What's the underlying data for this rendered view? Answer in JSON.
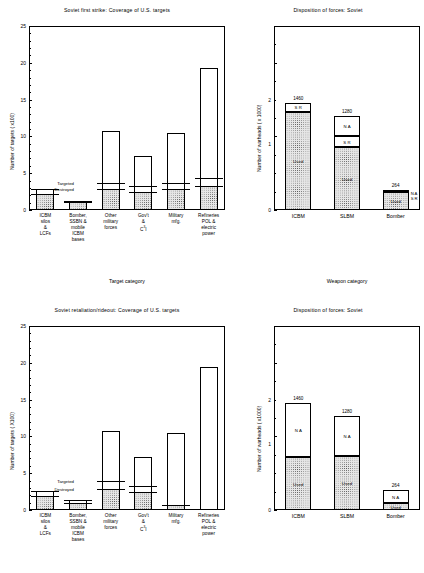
{
  "figure": {
    "panels": [
      {
        "id": "top-left",
        "title": "Soviet first strike:  Coverage of U.S. targets",
        "chart_data": {
          "type": "bar",
          "title": "Soviet first strike:  Coverage of U.S. targets",
          "xlabel": "Target category",
          "ylabel": "Number of targets ( x100)",
          "ylim": [
            0,
            25
          ],
          "yticks": [
            0,
            5,
            10,
            15,
            20,
            25
          ],
          "ytick_labels": [
            "0",
            "5",
            "10",
            "15",
            "20",
            "25"
          ],
          "grid": false,
          "categories": [
            "ICBM silos & LCFs",
            "Bomber, SSBN & mobile ICBM bases",
            "Other military forces",
            "Gov't & C3I",
            "Military mfg.",
            "Refineries POL & electric power"
          ],
          "series": [
            {
              "name": "Total targets",
              "values": [
                2.9,
                1.2,
                10.8,
                7.3,
                10.5,
                19.3
              ]
            },
            {
              "name": "Covered (shaded)",
              "values": [
                2.2,
                1.1,
                2.8,
                2.5,
                2.8,
                3.2
              ]
            },
            {
              "name": "Targeted",
              "values": [
                2.9,
                1.2,
                3.7,
                3.2,
                3.7,
                4.4
              ]
            },
            {
              "name": "Destroyed",
              "values": [
                2.2,
                1.1,
                2.8,
                2.5,
                2.8,
                3.2
              ]
            }
          ],
          "annotations": [
            {
              "label": "Targeted",
              "series": "Targeted"
            },
            {
              "label": "Destroyed",
              "series": "Destroyed"
            }
          ]
        }
      },
      {
        "id": "top-right",
        "title": "Disposition of forces: Soviet",
        "chart_data": {
          "type": "bar",
          "title": "Disposition of forces: Soviet",
          "xlabel": "Weapon category",
          "ylabel": "Number of warheads ( x 1000)",
          "ylim": [
            0,
            2.5
          ],
          "yticks": [
            0,
            1,
            2
          ],
          "ytick_labels": [
            "0",
            "1",
            "2"
          ],
          "grid": false,
          "categories": [
            "ICBM",
            "SLBM",
            "Bomber"
          ],
          "totals": [
            1460,
            1280,
            264
          ],
          "total_labels": [
            "1460",
            "1280",
            "264"
          ],
          "stacks": [
            {
              "category": "ICBM",
              "segments": [
                {
                  "label": "Used",
                  "value": 1.33,
                  "style": "hatch"
                },
                {
                  "label": "S R",
                  "value": 0.13,
                  "style": "plain"
                }
              ]
            },
            {
              "category": "SLBM",
              "segments": [
                {
                  "label": "Used",
                  "value": 0.85,
                  "style": "hatch"
                },
                {
                  "label": "S R",
                  "value": 0.15,
                  "style": "plain"
                },
                {
                  "label": "N A",
                  "value": 0.28,
                  "style": "plain"
                }
              ]
            },
            {
              "category": "Bomber",
              "segments": [
                {
                  "label": "Used",
                  "value": 0.24,
                  "style": "hatch"
                },
                {
                  "label": "S R",
                  "value": 0.015,
                  "style": "plain"
                },
                {
                  "label": "N A",
                  "value": 0.015,
                  "style": "dark"
                }
              ]
            }
          ],
          "side_labels": {
            "category": "Bomber",
            "labels": [
              "N A",
              "S R"
            ]
          }
        }
      },
      {
        "id": "bottom-left",
        "title": "Soviet retaliation/rideout:  Coverage of U.S. targets",
        "chart_data": {
          "type": "bar",
          "title": "Soviet retaliation/rideout:  Coverage of U.S. targets",
          "xlabel": "Target category",
          "ylabel": "Number of targets ( X100)",
          "ylim": [
            0,
            25
          ],
          "yticks": [
            0,
            5,
            10,
            15,
            20,
            25
          ],
          "ytick_labels": [
            "0",
            "5",
            "10",
            "15",
            "20",
            "25"
          ],
          "grid": false,
          "categories": [
            "ICBM silos & LCFs",
            "Bomber, SSBN & mobile ICBM bases",
            "Other military forces",
            "Gov't & C3I",
            "Military mfg.",
            "Refineries POL & electric power"
          ],
          "series": [
            {
              "name": "Total targets",
              "values": [
                2.6,
                1.3,
                10.7,
                7.2,
                10.5,
                19.4
              ]
            },
            {
              "name": "Covered (shaded)",
              "values": [
                1.9,
                1.0,
                2.8,
                2.4,
                0.7,
                0.0
              ]
            },
            {
              "name": "Targeted",
              "values": [
                2.6,
                1.3,
                3.9,
                3.2,
                0.7,
                0.0
              ]
            },
            {
              "name": "Destroyed",
              "values": [
                1.9,
                1.0,
                2.8,
                2.4,
                0.7,
                0.0
              ]
            }
          ],
          "annotations": [
            {
              "label": "Targeted",
              "series": "Targeted"
            },
            {
              "label": "Destroyed",
              "series": "Destroyed"
            }
          ]
        }
      },
      {
        "id": "bottom-right",
        "title": "Disposition of forces: Soviet",
        "chart_data": {
          "type": "bar",
          "title": "Disposition of forces: Soviet",
          "xlabel": "",
          "ylabel": "Number of warheads ( x1000)",
          "ylim": [
            0,
            2.5
          ],
          "yticks": [
            0,
            1,
            2
          ],
          "ytick_labels": [
            "0",
            "1",
            "2"
          ],
          "grid": false,
          "categories": [
            "ICBM",
            "SLBM",
            "Bomber"
          ],
          "totals": [
            1460,
            1280,
            264
          ],
          "total_labels": [
            "1460",
            "1280",
            "264"
          ],
          "stacks": [
            {
              "category": "ICBM",
              "segments": [
                {
                  "label": "Used",
                  "value": 0.72,
                  "style": "hatch"
                },
                {
                  "label": "N A",
                  "value": 0.74,
                  "style": "plain"
                }
              ]
            },
            {
              "category": "SLBM",
              "segments": [
                {
                  "label": "Used",
                  "value": 0.74,
                  "style": "hatch"
                },
                {
                  "label": "N A",
                  "value": 0.54,
                  "style": "plain"
                }
              ]
            },
            {
              "category": "Bomber",
              "segments": [
                {
                  "label": "Used",
                  "value": 0.09,
                  "style": "hatch"
                },
                {
                  "label": "N A",
                  "value": 0.175,
                  "style": "plain"
                }
              ]
            }
          ]
        }
      }
    ],
    "axis_text": {
      "target_category": "Target category",
      "weapon_category": "Weapon category",
      "targets_axis_top": "Number of targets ( x100)",
      "targets_axis_bottom": "Number of targets ( X100)",
      "warheads_axis_top": "Number of warheads ( x 1000)",
      "warheads_axis_bottom": "Number of warheads ( x1000)"
    },
    "marker_labels": {
      "targeted": "Targeted",
      "destroyed": "Destroyed"
    },
    "segment_labels": {
      "used": "Used",
      "sr": "S R",
      "na": "N A"
    },
    "categories_left": [
      [
        "ICBM",
        "silos",
        "&",
        "LCFs"
      ],
      [
        "Bomber,",
        "SSBN &",
        "mobile",
        "ICBM",
        "bases"
      ],
      [
        "Other",
        "military",
        "forces"
      ],
      [
        "Gov't",
        "&",
        "C3I"
      ],
      [
        "Military",
        "mfg."
      ],
      [
        "Refineries",
        "POL &",
        "electric",
        "power"
      ]
    ],
    "categories_right": [
      "ICBM",
      "SLBM",
      "Bomber"
    ],
    "ytick_labels_left": [
      "25",
      "20",
      "15",
      "10",
      "5",
      "0"
    ],
    "ytick_labels_right": [
      "2",
      "1",
      "0"
    ],
    "colors": {
      "ink": "#000000",
      "paper": "#ffffff",
      "fill": "#e6e6e6",
      "dark_fill": "#9a9a9a"
    }
  }
}
